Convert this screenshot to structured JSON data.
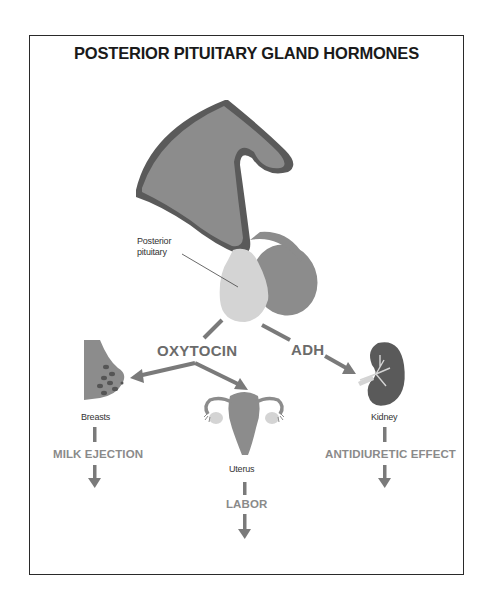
{
  "title": "POSTERIOR PITUITARY GLAND HORMONES",
  "gland": {
    "label_line1": "Posterior",
    "label_line2": "pituitary"
  },
  "hormones": {
    "oxytocin": "OXYTOCIN",
    "adh": "ADH"
  },
  "targets": {
    "breasts": {
      "label": "Breasts",
      "effect": "MILK EJECTION"
    },
    "uterus": {
      "label": "Uterus",
      "effect": "LABOR"
    },
    "kidney": {
      "label": "Kidney",
      "effect": "ANTIDIURETIC EFFECT"
    }
  },
  "colors": {
    "dark_gray": "#5a5a5a",
    "mid_gray": "#8c8c8c",
    "light_gray": "#d4d4d4",
    "arrow_gray": "#7a7a7a",
    "border": "#2a2a2a"
  }
}
